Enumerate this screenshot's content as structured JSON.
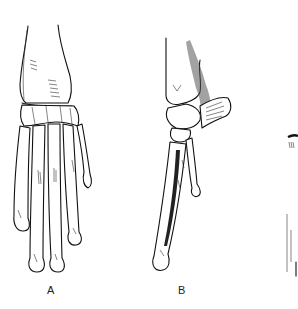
{
  "figure": {
    "panels": [
      {
        "id": "A",
        "label": "A",
        "description": "Dorsal view of wrist and hand bones"
      },
      {
        "id": "B",
        "label": "B",
        "description": "Lateral view of wrist and hand bones with shaded tendon"
      },
      {
        "id": "C",
        "label": "",
        "description": "Partially visible third panel, cropped at right edge"
      }
    ],
    "colors": {
      "ink": "#111111",
      "background": "#ffffff"
    }
  }
}
